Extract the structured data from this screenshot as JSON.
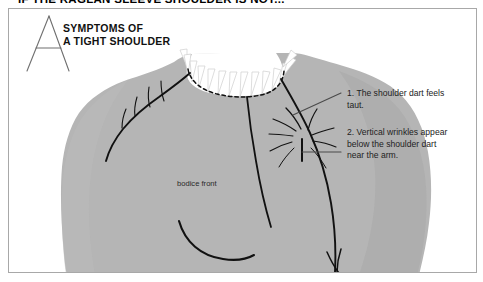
{
  "page": {
    "header_title": "IF THE RAGLAN SLEEVE SHOULDER IS NOT..."
  },
  "figure": {
    "marker_letter": "A",
    "heading_line_1": "SYMPTOMS OF",
    "heading_line_2": "A TIGHT SHOULDER",
    "garment_label": "bodice front",
    "callouts": [
      {
        "id": "callout-1",
        "text": "1.  The shoulder dart feels\ntaut."
      },
      {
        "id": "callout-2",
        "text": "2.  Vertical wrinkles appear\nbelow the shoulder dart\nnear the arm."
      }
    ],
    "colors": {
      "garment_fill": "#b5b5b5",
      "garment_shadow": "#a3a3a3",
      "seam_line": "#111111",
      "frame_border": "#a8a8a8",
      "leader_line": "#4a4a4a",
      "text": "#222222"
    }
  }
}
